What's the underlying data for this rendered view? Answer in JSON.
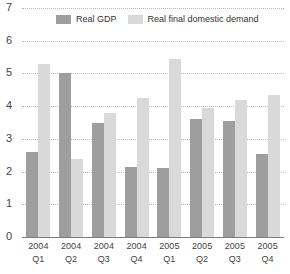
{
  "chart_data": {
    "type": "bar",
    "title": "",
    "subtitle": "",
    "xlabel": "",
    "ylabel": "",
    "ylim": [
      0,
      7
    ],
    "yticks": [
      0,
      1,
      2,
      3,
      4,
      5,
      6,
      7
    ],
    "grid": true,
    "legend_position": "top",
    "categories": [
      "2004 Q1",
      "2004 Q2",
      "2004 Q3",
      "2004 Q4",
      "2005 Q1",
      "2005 Q2",
      "2005 Q3",
      "2005 Q4"
    ],
    "category_lines": [
      {
        "year": "2004",
        "quarter": "Q1"
      },
      {
        "year": "2004",
        "quarter": "Q2"
      },
      {
        "year": "2004",
        "quarter": "Q3"
      },
      {
        "year": "2004",
        "quarter": "Q4"
      },
      {
        "year": "2005",
        "quarter": "Q1"
      },
      {
        "year": "2005",
        "quarter": "Q2"
      },
      {
        "year": "2005",
        "quarter": "Q3"
      },
      {
        "year": "2005",
        "quarter": "Q4"
      }
    ],
    "series": [
      {
        "name": "Real GDP",
        "color": "#9e9e9e",
        "values": [
          2.6,
          5.0,
          3.5,
          2.15,
          2.1,
          3.6,
          3.55,
          2.55
        ]
      },
      {
        "name": "Real final domestic demand",
        "color": "#d9d9d9",
        "values": [
          5.3,
          2.4,
          3.8,
          4.25,
          5.45,
          3.95,
          4.2,
          4.35
        ]
      }
    ]
  }
}
